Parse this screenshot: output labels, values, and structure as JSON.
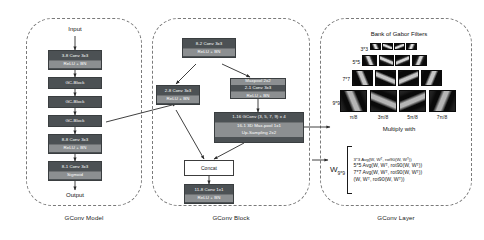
{
  "panels": {
    "model": {
      "caption": "GConv Model"
    },
    "block": {
      "caption": "GConv Block"
    },
    "layer": {
      "caption": "GConv Layer"
    }
  },
  "model": {
    "input_label": "Input",
    "output_label": "Output",
    "blocks": [
      {
        "title": "3-8 Conv 3x3",
        "sub": "ReLU + BN"
      },
      {
        "title": "GC-Block",
        "sub": ""
      },
      {
        "title": "GC-Block",
        "sub": ""
      },
      {
        "title": "GC-Block",
        "sub": ""
      },
      {
        "title": "8-8 Conv 3x3",
        "sub": "ReLU + BN"
      },
      {
        "title": "8-1 Conv 3x3",
        "sub": "Sigmoid"
      }
    ]
  },
  "block": {
    "top": {
      "title": "8-2 Conv 3x3",
      "sub": "ReLU + BN"
    },
    "left": {
      "title": "2-8 Conv 3x3",
      "sub": "ReLU + BN"
    },
    "maxpool": {
      "line1": "Maxpool 2x2",
      "line2": "2-1 Conv 3x3",
      "line3": "ReLU + BN"
    },
    "gconv": {
      "line1": "1-16 GConv (3, 5, 7, 9) x 4",
      "line2": "16-1 3D Max-pool 1x1",
      "line3": "Up-Sampling 2x2"
    },
    "concat": "Concat",
    "bottom": {
      "title": "11-8 Conv 1x1",
      "sub": "ReLU + BN"
    }
  },
  "layer": {
    "bank_title": "Bank of Gabor Filters",
    "sizes": [
      "3*3",
      "5*5",
      "7*7",
      "9*9"
    ],
    "angles": [
      "π/8",
      "3π/8",
      "5π/8",
      "7π/8"
    ],
    "multiply_with": "Multiply with",
    "equation": {
      "lhs": "W",
      "lhs_sub": "9*9",
      "lines": [
        "3*3 Avg(W, Wᵀ, rot90(W, Wᵀ))",
        "5*5 Avg(W, Wᵀ, rot90(W, Wᵀ))",
        "7*7 Avg(W, Wᵀ, rot90(W, Wᵀ))",
        "(W, Wᵀ, rot90(W, Wᵀ))"
      ]
    }
  },
  "colors": {
    "block_fill": "#4c5154",
    "sub_fill": "#8c8f91",
    "panel_border": "#7a7a7a",
    "filter_bg": "#0b0b0b"
  }
}
